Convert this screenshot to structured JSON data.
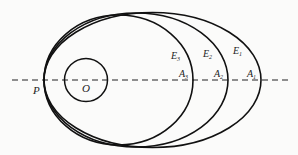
{
  "diagram": {
    "labels": {
      "P": "P",
      "O": "O",
      "E1": "E",
      "E1_sub": "1",
      "E2": "E",
      "E2_sub": "2",
      "E3": "E",
      "E3_sub": "3",
      "A1": "A",
      "A1_sub": "1",
      "A2": "A",
      "A2_sub": "2",
      "A3": "A",
      "A3_sub": "3"
    },
    "colors": {
      "stroke": "#111111",
      "background": "#fbfbfa"
    }
  }
}
